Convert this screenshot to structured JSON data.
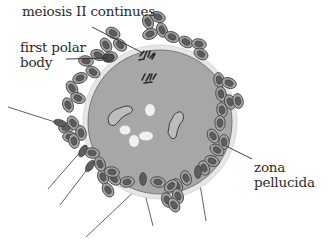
{
  "figure": {
    "labels": {
      "meiosis": "meiosis II continues",
      "polar_line1": "first polar",
      "polar_line2": "body",
      "zona_line1": "zona",
      "zona_line2": "pellucida"
    },
    "colors": {
      "cytoplasm": "#a6a6a6",
      "zona": "#e4e4e4",
      "cell_outer": "#9a9a9a",
      "cell_nucleus": "#5a5a5a",
      "sperm_head": "#5e5e5e",
      "text": "#2b2b2b"
    }
  }
}
